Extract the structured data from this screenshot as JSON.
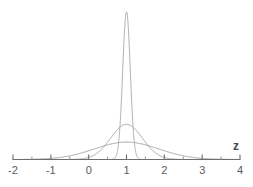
{
  "chart_data": {
    "type": "line",
    "title": "",
    "subtitle": "",
    "xlabel": "z",
    "ylabel": "",
    "xlim": [
      -2,
      4
    ],
    "ylim": [
      0,
      4.2
    ],
    "grid": false,
    "legend": "none",
    "annotations": [],
    "x_ticks": [
      -2,
      -1,
      0,
      1,
      2,
      3,
      4
    ],
    "x_tick_labels": [
      "-2",
      "-1",
      "0",
      "1",
      "2",
      "3",
      "4"
    ],
    "x_minor_ticks": [
      -1.5,
      -0.5,
      0.5,
      1.5,
      2.5,
      3.5
    ],
    "series": [
      {
        "name": "narrow",
        "distribution": "normal",
        "mean": 1,
        "sd": 0.1,
        "peak_height": 3.99,
        "color": "#a8a8a8",
        "line_width": 0.9
      },
      {
        "name": "medium",
        "distribution": "normal",
        "mean": 1,
        "sd": 0.42,
        "peak_height": 0.95,
        "color": "#9a9a9a",
        "line_width": 0.9
      },
      {
        "name": "wide",
        "distribution": "normal",
        "mean": 1,
        "sd": 0.85,
        "peak_height": 0.47,
        "color": "#949494",
        "line_width": 0.9
      }
    ]
  },
  "axis": {
    "name_label": "z",
    "axis_color": "#6e6e6e",
    "tick_color": "#6e6e6e",
    "label_color": "#5a5a5a"
  },
  "labels": {
    "t0": "-2",
    "t1": "-1",
    "t2": "0",
    "t3": "1",
    "t4": "2",
    "t5": "3",
    "t6": "4"
  }
}
